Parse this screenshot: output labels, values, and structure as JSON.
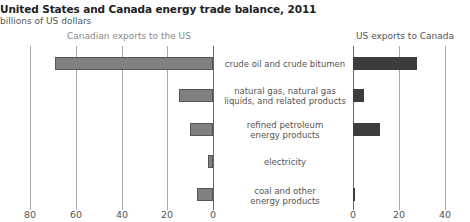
{
  "header": {
    "title": "United States and Canada energy trade balance, 2011",
    "subtitle": "billions of US dollars"
  },
  "panels": {
    "left_label": "Canadian exports to the US",
    "right_label": "US exports to Canada"
  },
  "axes": {
    "left_ticks": [
      "80",
      "60",
      "40",
      "20",
      "0"
    ],
    "right_ticks": [
      "0",
      "20",
      "40"
    ]
  },
  "categories": [
    {
      "label_line1": "crude oil and crude bitumen",
      "label_line2": ""
    },
    {
      "label_line1": "natural gas, natural gas",
      "label_line2": "liquids, and related products"
    },
    {
      "label_line1": "refined petroleum",
      "label_line2": "energy products"
    },
    {
      "label_line1": "electricity",
      "label_line2": ""
    },
    {
      "label_line1": "coal and other",
      "label_line2": "energy products"
    }
  ],
  "colors": {
    "canadian_exports": "#808080",
    "us_exports": "#3c3c3c"
  },
  "chart_data": {
    "type": "bar",
    "orientation": "horizontal",
    "title": "United States and Canada energy trade balance, 2011",
    "subtitle": "billions of US dollars",
    "categories": [
      "crude oil and crude bitumen",
      "natural gas, natural gas liquids, and related products",
      "refined petroleum energy products",
      "electricity",
      "coal and other energy products"
    ],
    "series": [
      {
        "name": "Canadian exports to the US",
        "values": [
          69,
          15,
          10,
          2,
          7
        ],
        "xlim": [
          80,
          0
        ],
        "color": "#808080"
      },
      {
        "name": "US exports to Canada",
        "values": [
          28,
          5,
          12,
          0,
          1
        ],
        "xlim": [
          0,
          40
        ],
        "color": "#3c3c3c"
      }
    ],
    "left_axis_ticks": [
      80,
      60,
      40,
      20,
      0
    ],
    "right_axis_ticks": [
      0,
      20,
      40
    ],
    "grid": true,
    "legend": "panel headers"
  }
}
